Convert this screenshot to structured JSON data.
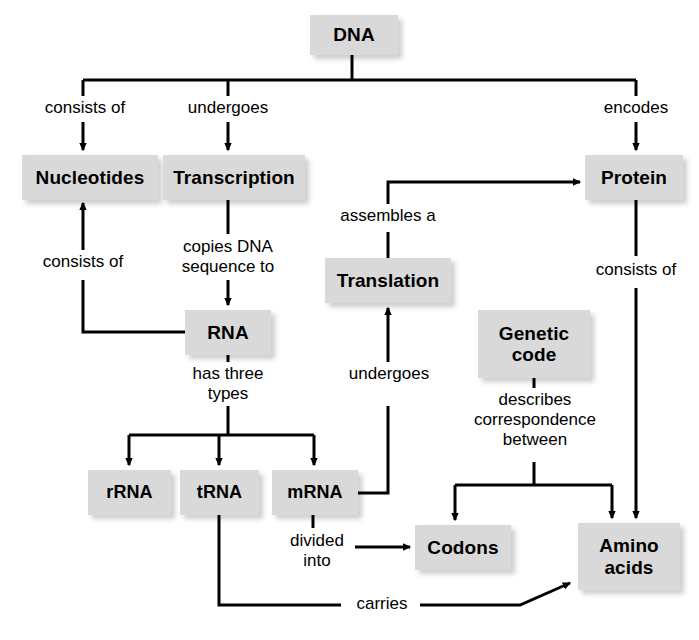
{
  "diagram": {
    "colors": {
      "node_fill": "#d9d9d9",
      "node_text": "#000000",
      "connector": "#000000",
      "background": "#ffffff"
    },
    "nodes": [
      {
        "id": "dna",
        "label": "DNA",
        "x": 310,
        "y": 15,
        "w": 88,
        "h": 40
      },
      {
        "id": "nucleotides",
        "label": "Nucleotides",
        "x": 22,
        "y": 155,
        "w": 136,
        "h": 45
      },
      {
        "id": "transcription",
        "label": "Transcription",
        "x": 163,
        "y": 155,
        "w": 142,
        "h": 45
      },
      {
        "id": "protein",
        "label": "Protein",
        "x": 585,
        "y": 155,
        "w": 98,
        "h": 45
      },
      {
        "id": "translation",
        "label": "Translation",
        "x": 325,
        "y": 258,
        "w": 126,
        "h": 45
      },
      {
        "id": "rna",
        "label": "RNA",
        "x": 185,
        "y": 310,
        "w": 86,
        "h": 45
      },
      {
        "id": "genetic_code",
        "label": "Genetic\ncode",
        "x": 478,
        "y": 310,
        "w": 112,
        "h": 68
      },
      {
        "id": "rrna",
        "label": "rRNA",
        "x": 88,
        "y": 470,
        "w": 83,
        "h": 45
      },
      {
        "id": "trna",
        "label": "tRNA",
        "x": 180,
        "y": 470,
        "w": 79,
        "h": 45
      },
      {
        "id": "mrna",
        "label": "mRNA",
        "x": 272,
        "y": 470,
        "w": 86,
        "h": 45
      },
      {
        "id": "codons",
        "label": "Codons",
        "x": 415,
        "y": 525,
        "w": 96,
        "h": 45
      },
      {
        "id": "amino_acids",
        "label": "Amino\nacids",
        "x": 578,
        "y": 523,
        "w": 102,
        "h": 67
      }
    ],
    "link_labels": [
      {
        "id": "consists_of_1",
        "text": "consists of",
        "x": 30,
        "y": 98,
        "w": 110
      },
      {
        "id": "undergoes_1",
        "text": "undergoes",
        "x": 176,
        "y": 98,
        "w": 104
      },
      {
        "id": "encodes",
        "text": "encodes",
        "x": 593,
        "y": 98,
        "w": 86
      },
      {
        "id": "consists_of_2",
        "text": "consists of",
        "x": 28,
        "y": 252,
        "w": 110
      },
      {
        "id": "copies_dna",
        "text": "copies DNA\nsequence to",
        "x": 170,
        "y": 240,
        "w": 116
      },
      {
        "id": "assembles_a",
        "text": "assembles a",
        "x": 331,
        "y": 206,
        "w": 114
      },
      {
        "id": "consists_of_3",
        "text": "consists of",
        "x": 581,
        "y": 260,
        "w": 110
      },
      {
        "id": "has_three",
        "text": "has three\ntypes",
        "x": 179,
        "y": 366,
        "w": 98
      },
      {
        "id": "undergoes_2",
        "text": "undergoes",
        "x": 337,
        "y": 366,
        "w": 104
      },
      {
        "id": "describes",
        "text": "describes\ncorrespondence\nbetween",
        "x": 464,
        "y": 392,
        "w": 142
      },
      {
        "id": "divided_into",
        "text": "divided\ninto",
        "x": 281,
        "y": 531,
        "w": 72
      },
      {
        "id": "carries",
        "text": "carries",
        "x": 347,
        "y": 594,
        "w": 70
      }
    ],
    "connectors": [
      {
        "id": "dna-stem-to-bar",
        "from": "dna",
        "to": "top-bar"
      },
      {
        "id": "bar-to-nucleotides",
        "from": "top-bar",
        "to": "nucleotides"
      },
      {
        "id": "bar-to-transcription",
        "from": "top-bar",
        "to": "transcription"
      },
      {
        "id": "bar-to-protein",
        "from": "top-bar",
        "to": "protein"
      },
      {
        "id": "transcription-to-rna",
        "from": "transcription",
        "to": "rna"
      },
      {
        "id": "rna-to-nucleotides",
        "from": "rna",
        "to": "nucleotides"
      },
      {
        "id": "rna-to-three-types",
        "from": "rna",
        "to": "rrna-trna-mrna"
      },
      {
        "id": "mrna-to-translation",
        "from": "mrna",
        "to": "translation"
      },
      {
        "id": "translation-to-protein",
        "from": "translation",
        "to": "protein"
      },
      {
        "id": "protein-to-amino-acids",
        "from": "protein",
        "to": "amino_acids"
      },
      {
        "id": "code-to-codons-aminos",
        "from": "genetic_code",
        "to": "codons-and-amino-acids"
      },
      {
        "id": "mrna-to-codons",
        "from": "mrna",
        "to": "codons"
      },
      {
        "id": "trna-to-amino-acids",
        "from": "trna",
        "to": "amino_acids"
      }
    ]
  }
}
